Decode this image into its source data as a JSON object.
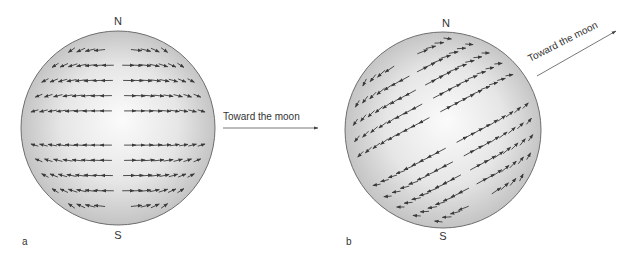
{
  "panels": [
    {
      "id": "a",
      "panel_label": "a",
      "north_label": "N",
      "south_label": "S",
      "arrow_label": "Toward the moon",
      "description": "Tidal flow arrows: northern hemisphere flows diverge from center toward left/right limbs; southern hemisphere likewise. Bulge axis horizontal (moon in equatorial plane)."
    },
    {
      "id": "b",
      "panel_label": "b",
      "north_label": "N",
      "south_label": "S",
      "arrow_label": "Toward the moon",
      "description": "Tidal flow arrows with bulge axis tilted (moon above equatorial plane)."
    }
  ],
  "colors": {
    "sphere_fill_light": "#fafafa",
    "sphere_fill_dark": "#bdbdbd",
    "sphere_outline": "#6e6e6e",
    "arrow": "#3a3a3a",
    "text": "#333333"
  }
}
